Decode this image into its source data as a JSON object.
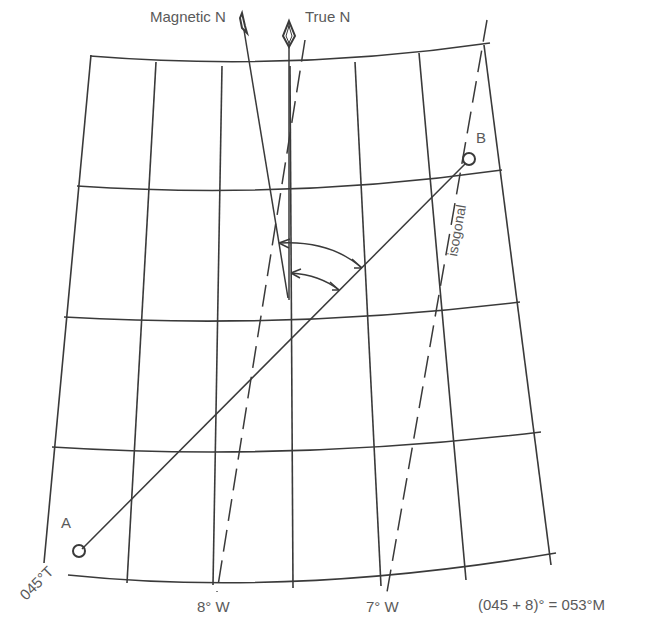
{
  "labels": {
    "magnetic_north": "Magnetic N",
    "true_north": "True N",
    "point_a": "A",
    "point_b": "B",
    "isogonal": "isogonal",
    "true_bearing": "045°T",
    "meridian_8w": "8° W",
    "meridian_7w": "7° W",
    "formula": "(045 + 8)° = 053°M"
  },
  "colors": {
    "ink": "#3a3a3a",
    "text": "#5a5a5a",
    "background": "#ffffff"
  },
  "values": {
    "true_course_deg": 45,
    "variation_deg": 8,
    "variation_direction": "W",
    "magnetic_course_deg": 53
  }
}
